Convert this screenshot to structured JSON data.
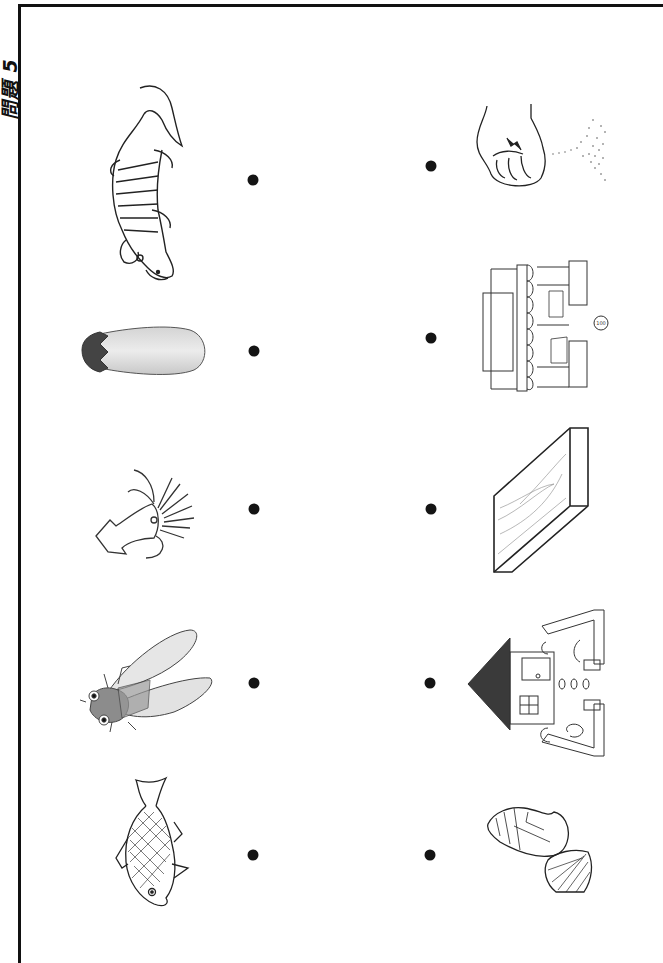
{
  "worksheet": {
    "title": "問題 5",
    "instruction_type": "matching",
    "left_items": [
      {
        "id": "crocodile",
        "label": "ワニ",
        "icon": "crocodile-icon"
      },
      {
        "id": "eggplant",
        "label": "ナス",
        "icon": "eggplant-icon"
      },
      {
        "id": "squid",
        "label": "イカ",
        "icon": "squid-icon"
      },
      {
        "id": "cicada",
        "label": "セミ",
        "icon": "cicada-icon"
      },
      {
        "id": "fish",
        "label": "タイ",
        "icon": "fish-icon"
      }
    ],
    "right_items": [
      {
        "id": "sand",
        "label": "砂",
        "icon": "hand-sand-icon"
      },
      {
        "id": "shop",
        "label": "店",
        "icon": "shop-icon"
      },
      {
        "id": "board",
        "label": "板",
        "icon": "wooden-board-icon"
      },
      {
        "id": "garden",
        "label": "庭",
        "icon": "house-garden-icon"
      },
      {
        "id": "shells",
        "label": "貝",
        "icon": "seashells-icon"
      }
    ],
    "coin_label": "100",
    "colors": {
      "ink": "#111111",
      "dot": "#141414",
      "paper": "#ffffff"
    }
  }
}
